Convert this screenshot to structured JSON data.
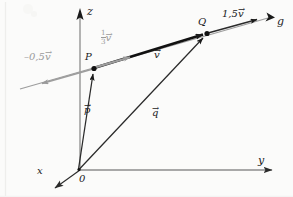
{
  "figure": {
    "background_color": "#fbfbfa",
    "ink_color": "#1a1a1a",
    "accent_color": "#9a9a9a"
  },
  "axes": {
    "z": {
      "label": "z",
      "direction": "up",
      "tip": [
        80,
        10
      ]
    },
    "y": {
      "label": "y",
      "direction": "right",
      "tip": [
        281,
        170
      ]
    },
    "x": {
      "label": "x",
      "direction": "down-left",
      "tip": [
        52,
        190
      ]
    },
    "origin": {
      "label": "0",
      "position": [
        78,
        170
      ]
    }
  },
  "points": [
    {
      "name": "P",
      "label": "P",
      "position": [
        94,
        68
      ]
    },
    {
      "name": "Q",
      "label": "Q",
      "position": [
        207,
        33
      ]
    }
  ],
  "line": {
    "name": "g",
    "label": "g",
    "color": "#9a9a9a",
    "start": [
      20,
      88
    ],
    "end": [
      272,
      16
    ]
  },
  "vectors": [
    {
      "name": "p",
      "symbol": "p",
      "label": "p",
      "arrow_accent": "→",
      "from": "origin",
      "to": "P",
      "color": "#1a1a1a",
      "label_position": [
        85,
        112
      ]
    },
    {
      "name": "q",
      "symbol": "q",
      "label": "q",
      "arrow_accent": "→",
      "from": "origin",
      "to": "Q",
      "color": "#1a1a1a",
      "label_position": [
        152,
        115
      ]
    },
    {
      "name": "v",
      "symbol": "v",
      "label": "v",
      "arrow_accent": "→",
      "from": "P",
      "to": "Q",
      "color": "#1a1a1a",
      "label_position": [
        155,
        56
      ]
    }
  ],
  "scalar_multiples": [
    {
      "name": "one-third-v",
      "scalar_text": "1/3",
      "numerator": "1",
      "denominator": "3",
      "symbol": "v",
      "color": "#9a9a9a",
      "label_position": [
        103,
        35
      ],
      "from": [
        94,
        68
      ],
      "to": [
        135,
        56
      ]
    },
    {
      "name": "negative-half-v",
      "scalar_text": "–0,5",
      "symbol": "v",
      "color": "#9a9a9a",
      "label_position": [
        27,
        57
      ],
      "from": [
        94,
        68
      ],
      "to": [
        38,
        84
      ]
    },
    {
      "name": "one-point-five-v",
      "scalar_text": "1,5",
      "symbol": "v",
      "color": "#1a1a1a",
      "label_position": [
        226,
        14
      ],
      "from": [
        207,
        33
      ],
      "to": [
        268,
        17
      ]
    }
  ]
}
